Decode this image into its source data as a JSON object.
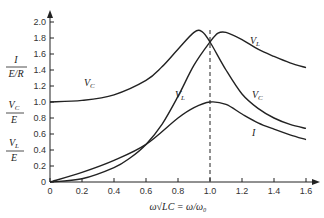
{
  "chart_data": {
    "type": "line",
    "title": "",
    "xlabel": "ω√LC = ω/ω₀",
    "ylabel_parts": [
      "I/(E/R)",
      "V_C/E",
      "V_L/E"
    ],
    "x_ticks": [
      "0",
      "0.2",
      "0.4",
      "0.6",
      "0.8",
      "1.0",
      "1.2",
      "1.4",
      "1.6"
    ],
    "y_ticks": [
      "0",
      "0.2",
      "0.4",
      "0.6",
      "0.8",
      "1.0",
      "1.2",
      "1.4",
      "1.6",
      "1.8",
      "2.0"
    ],
    "xlim": [
      0,
      1.6
    ],
    "ylim": [
      0,
      2.0
    ],
    "grid": false,
    "annotations": [
      "dashed vertical line at ω/ω₀ = 1.0"
    ],
    "series": [
      {
        "name": "V_C",
        "x": [
          0,
          0.2,
          0.4,
          0.6,
          0.7,
          0.8,
          0.9,
          0.95,
          1.0,
          1.1,
          1.2,
          1.3,
          1.4,
          1.5,
          1.6
        ],
        "values": [
          1.0,
          1.02,
          1.09,
          1.27,
          1.44,
          1.66,
          1.87,
          1.88,
          1.75,
          1.4,
          1.1,
          0.92,
          0.8,
          0.72,
          0.67
        ]
      },
      {
        "name": "V_L",
        "x": [
          0,
          0.2,
          0.4,
          0.5,
          0.6,
          0.7,
          0.8,
          0.9,
          1.0,
          1.05,
          1.1,
          1.2,
          1.3,
          1.4,
          1.5,
          1.6
        ],
        "values": [
          0,
          0.04,
          0.18,
          0.3,
          0.47,
          0.72,
          1.07,
          1.46,
          1.75,
          1.86,
          1.87,
          1.78,
          1.66,
          1.57,
          1.49,
          1.43
        ]
      },
      {
        "name": "I",
        "x": [
          0,
          0.2,
          0.4,
          0.6,
          0.8,
          0.9,
          1.0,
          1.1,
          1.2,
          1.3,
          1.4,
          1.5,
          1.6
        ],
        "values": [
          0,
          0.12,
          0.27,
          0.47,
          0.8,
          0.93,
          1.0,
          0.97,
          0.85,
          0.74,
          0.66,
          0.59,
          0.53
        ]
      }
    ],
    "curve_labels": {
      "vc_left": "V_C",
      "vl_mid": "V_L",
      "vl_right": "V_L",
      "vc_right": "V_C",
      "i_right": "I"
    }
  },
  "labels": {
    "y1": {
      "num": "I",
      "den": "E/R"
    },
    "y2": {
      "num": "V_C",
      "den": "E"
    },
    "y3": {
      "num": "V_L",
      "den": "E"
    },
    "xaxis": "ω√LC = ω/ω₀"
  }
}
